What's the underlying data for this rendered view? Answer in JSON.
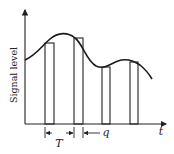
{
  "diagram": {
    "y_axis_label": "Signal level",
    "x_axis_label": "t",
    "period_label": "T",
    "pulse_width_label": "q",
    "colors": {
      "stroke": "#222222",
      "background": "#ffffff"
    },
    "pulses": [
      {
        "index": 1,
        "x_start": 45,
        "x_end": 54,
        "top": 43
      },
      {
        "index": 2,
        "x_start": 74,
        "x_end": 83,
        "top": 38
      },
      {
        "index": 3,
        "x_start": 102,
        "x_end": 110,
        "top": 67
      },
      {
        "index": 4,
        "x_start": 130,
        "x_end": 138,
        "top": 62
      }
    ]
  }
}
